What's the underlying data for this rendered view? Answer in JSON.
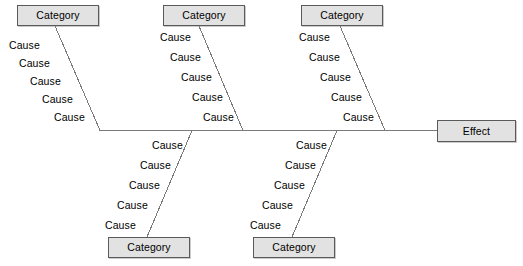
{
  "diagram": {
    "type": "fishbone-ishikawa",
    "canvas": {
      "width": 523,
      "height": 266
    },
    "colors": {
      "background": "#ffffff",
      "box_fill": "#e2e2e2",
      "box_border": "#5a5a5a",
      "line": "#7a7a7a",
      "text": "#000000"
    },
    "effect": {
      "label": "Effect",
      "box": {
        "x": 437,
        "y": 120,
        "w": 79,
        "h": 22
      }
    },
    "spine": {
      "x1": 100,
      "y1": 130.5,
      "x2": 437,
      "y2": 130.5
    },
    "branches": [
      {
        "id": "top-1",
        "side": "top",
        "category": {
          "label": "Category",
          "box": {
            "x": 17,
            "y": 5,
            "w": 82,
            "h": 21
          }
        },
        "line": {
          "x1": 55,
          "y1": 26,
          "x2": 100,
          "y2": 130.5
        },
        "causes": [
          {
            "label": "Cause",
            "x": 9,
            "y": 40
          },
          {
            "label": "Cause",
            "x": 19,
            "y": 58
          },
          {
            "label": "Cause",
            "x": 30,
            "y": 76
          },
          {
            "label": "Cause",
            "x": 42,
            "y": 94
          },
          {
            "label": "Cause",
            "x": 54,
            "y": 112
          }
        ]
      },
      {
        "id": "top-2",
        "side": "top",
        "category": {
          "label": "Category",
          "box": {
            "x": 163,
            "y": 5,
            "w": 82,
            "h": 21
          }
        },
        "line": {
          "x1": 199,
          "y1": 26,
          "x2": 243,
          "y2": 130.5
        },
        "causes": [
          {
            "label": "Cause",
            "x": 160,
            "y": 32
          },
          {
            "label": "Cause",
            "x": 170,
            "y": 52
          },
          {
            "label": "Cause",
            "x": 181,
            "y": 72
          },
          {
            "label": "Cause",
            "x": 192,
            "y": 92
          },
          {
            "label": "Cause",
            "x": 203,
            "y": 112
          }
        ]
      },
      {
        "id": "top-3",
        "side": "top",
        "category": {
          "label": "Category",
          "box": {
            "x": 301,
            "y": 5,
            "w": 82,
            "h": 21
          }
        },
        "line": {
          "x1": 340,
          "y1": 26,
          "x2": 385,
          "y2": 130.5
        },
        "causes": [
          {
            "label": "Cause",
            "x": 299,
            "y": 32
          },
          {
            "label": "Cause",
            "x": 309,
            "y": 52
          },
          {
            "label": "Cause",
            "x": 320,
            "y": 72
          },
          {
            "label": "Cause",
            "x": 331,
            "y": 92
          },
          {
            "label": "Cause",
            "x": 343,
            "y": 112
          }
        ]
      },
      {
        "id": "bottom-1",
        "side": "bottom",
        "category": {
          "label": "Category",
          "box": {
            "x": 108,
            "y": 237,
            "w": 82,
            "h": 21
          }
        },
        "line": {
          "x1": 147,
          "y1": 237,
          "x2": 192,
          "y2": 130.5
        },
        "causes": [
          {
            "label": "Cause",
            "x": 152,
            "y": 140
          },
          {
            "label": "Cause",
            "x": 140,
            "y": 160
          },
          {
            "label": "Cause",
            "x": 129,
            "y": 180
          },
          {
            "label": "Cause",
            "x": 117,
            "y": 200
          },
          {
            "label": "Cause",
            "x": 105,
            "y": 220
          }
        ]
      },
      {
        "id": "bottom-2",
        "side": "bottom",
        "category": {
          "label": "Category",
          "box": {
            "x": 253,
            "y": 237,
            "w": 82,
            "h": 21
          }
        },
        "line": {
          "x1": 292,
          "y1": 237,
          "x2": 337,
          "y2": 130.5
        },
        "causes": [
          {
            "label": "Cause",
            "x": 296,
            "y": 140
          },
          {
            "label": "Cause",
            "x": 285,
            "y": 160
          },
          {
            "label": "Cause",
            "x": 274,
            "y": 180
          },
          {
            "label": "Cause",
            "x": 262,
            "y": 200
          },
          {
            "label": "Cause",
            "x": 250,
            "y": 220
          }
        ]
      }
    ]
  }
}
